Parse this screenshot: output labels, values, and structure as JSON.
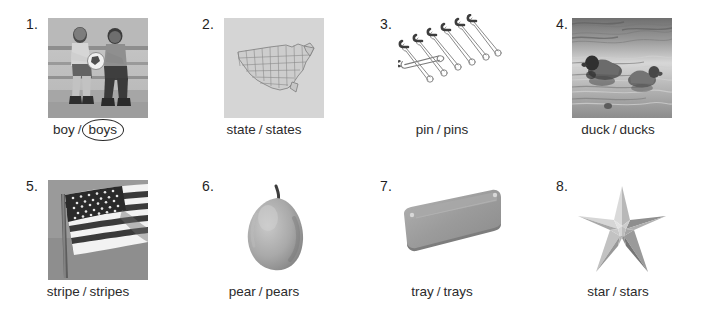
{
  "worksheet": {
    "title": "Singular and plural nouns picture exercise",
    "items": [
      {
        "number": "1.",
        "image_alt": "two boys sitting on bleachers with a soccer ball",
        "image_kind": "photo",
        "singular": "boy",
        "separator": "/",
        "plural": "boys",
        "circled": "plural"
      },
      {
        "number": "2.",
        "image_alt": "outline map of the United States showing states",
        "image_kind": "photo",
        "singular": "state",
        "separator": "/",
        "plural": "states",
        "circled": "none"
      },
      {
        "number": "3.",
        "image_alt": "six safety pins arranged diagonally",
        "image_kind": "plain",
        "singular": "pin",
        "separator": "/",
        "plural": "pins",
        "circled": "none"
      },
      {
        "number": "4.",
        "image_alt": "two ducks swimming on water",
        "image_kind": "photo",
        "singular": "duck",
        "separator": "/",
        "plural": "ducks",
        "circled": "none"
      },
      {
        "number": "5.",
        "image_alt": "American flag with stripes on a flagpole",
        "image_kind": "photo",
        "singular": "stripe",
        "separator": "/",
        "plural": "stripes",
        "circled": "none"
      },
      {
        "number": "6.",
        "image_alt": "a single pear with stem",
        "image_kind": "plain",
        "singular": "pear",
        "separator": "/",
        "plural": "pears",
        "circled": "none"
      },
      {
        "number": "7.",
        "image_alt": "a rectangular serving tray seen at an angle",
        "image_kind": "plain",
        "singular": "tray",
        "separator": "/",
        "plural": "trays",
        "circled": "none"
      },
      {
        "number": "8.",
        "image_alt": "a five pointed three dimensional star",
        "image_kind": "plain",
        "singular": "star",
        "separator": "/",
        "plural": "stars",
        "circled": "none"
      }
    ]
  },
  "colors": {
    "page_background": "#ffffff",
    "text": "#2b2b2b",
    "photo_background": "#cfcfcf",
    "ink": "#1f1f1f"
  }
}
